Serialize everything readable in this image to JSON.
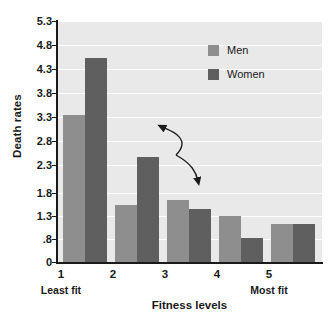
{
  "chart_data": {
    "type": "bar",
    "title": "",
    "xlabel": "Fitness levels",
    "ylabel": "Death rates",
    "categories": [
      "1",
      "2",
      "3",
      "4",
      "5"
    ],
    "category_notes": {
      "first": "Least fit",
      "last": "Most fit"
    },
    "series": [
      {
        "name": "Men",
        "color": "#8e8e8e",
        "values": [
          3.45,
          1.52,
          1.63,
          1.3,
          1.12
        ]
      },
      {
        "name": "Women",
        "color": "#5f5f5f",
        "values": [
          4.67,
          2.55,
          1.45,
          0.82,
          1.12
        ]
      }
    ],
    "yticks": [
      "0",
      ".8",
      "1.3",
      "1.8",
      "2.3",
      "2.8",
      "3.3",
      "3.8",
      "4.3",
      "4.8",
      "5.3"
    ],
    "ytick_values": [
      0,
      0.8,
      1.3,
      1.8,
      2.3,
      2.8,
      3.3,
      3.8,
      4.3,
      4.8,
      5.3
    ],
    "ylim": [
      0,
      5.3
    ],
    "grid": true,
    "legend_position": "upper right",
    "annotation": "curved double arrow from men bar 1 to women bar 2",
    "plot_background": "#e9e9e9",
    "gridline_color": "#ffffff"
  },
  "legend": {
    "items": [
      {
        "label": "Men",
        "color": "#8e8e8e"
      },
      {
        "label": "Women",
        "color": "#5f5f5f"
      }
    ]
  },
  "axes": {
    "y_title": "Death rates",
    "x_title": "Fitness levels",
    "y_ticks": [
      "5.3",
      "4.8",
      "4.3",
      "3.8",
      "3.3",
      "2.8",
      "2.3",
      "1.8",
      "1.3",
      ".8",
      "0"
    ],
    "x_ticks": [
      "1",
      "2",
      "3",
      "4",
      "5"
    ],
    "x_note_left": "Least fit",
    "x_note_right": "Most fit"
  }
}
